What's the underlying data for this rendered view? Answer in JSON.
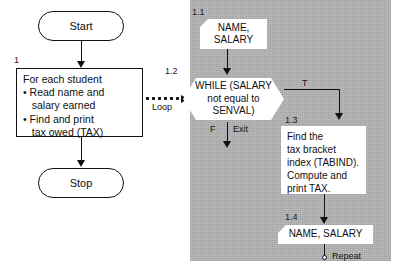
{
  "diagram": {
    "panel_color": "#b4b4b4",
    "line_color": "#111111"
  },
  "left_flow": {
    "start": {
      "label": "Start"
    },
    "step_number": "1",
    "process": {
      "line1": "For each student",
      "line2": "• Read name and",
      "line3": "   salary earned",
      "line4": "• Find and print",
      "line5": "   tax owed (TAX)"
    },
    "stop": {
      "label": "Stop"
    }
  },
  "bridge": {
    "loop_label": "Loop"
  },
  "panel_flow": {
    "step_1_1": {
      "number": "1.1",
      "line1": "NAME,",
      "line2": "SALARY"
    },
    "step_1_2": {
      "number": "1.2",
      "line1": "WHILE (SALARY",
      "line2": "not equal to",
      "line3": "SENVAL)",
      "true_label": "T",
      "false_label": "F",
      "exit_label": "Exit"
    },
    "step_1_3": {
      "number": "1.3",
      "line1": "Find the",
      "line2": "tax bracket",
      "line3": "index (TABIND).",
      "line4": "Compute and",
      "line5": "print TAX."
    },
    "step_1_4": {
      "number": "1.4",
      "text": "NAME, SALARY",
      "repeat_label": "Repeat"
    }
  }
}
